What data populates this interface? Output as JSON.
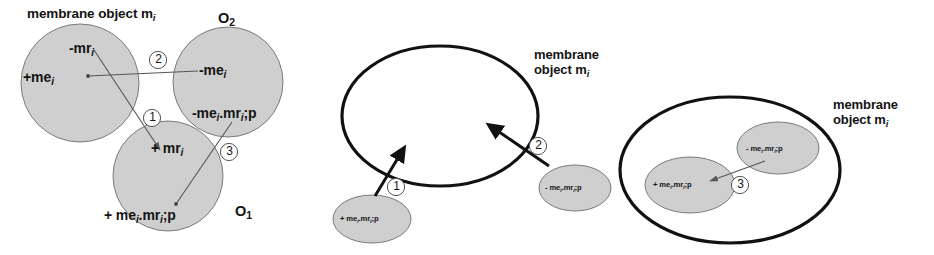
{
  "figure": {
    "colors": {
      "shape_fill": "#cfcfcf",
      "shape_stroke": "#6b6b6b",
      "membrane_stroke": "#111111",
      "line": "#555555",
      "text": "#141414"
    }
  },
  "panel_left": {
    "caption": "membrane object m",
    "caption_sub": "i",
    "circles": [
      {
        "id": "circle-upper-left",
        "labels": [
          {
            "text": "-mr",
            "sub": "i"
          },
          {
            "text": "+me",
            "sub": "i"
          }
        ]
      },
      {
        "id": "circle-upper-right",
        "name": "O",
        "name_sub": "2",
        "labels": [
          {
            "text": "-me",
            "sub": "i"
          },
          {
            "text": "-me",
            "sub": "i",
            "text2": ".mr",
            "sub2": "i",
            "text3": ";p"
          }
        ]
      },
      {
        "id": "circle-bottom",
        "name": "O",
        "name_sub": "1",
        "labels": [
          {
            "text": "+ mr",
            "sub": "i"
          },
          {
            "text": "+ me",
            "sub": "i",
            "text2": ".mr",
            "sub2": "i",
            "text3": ";p"
          }
        ]
      }
    ],
    "connectors": [
      {
        "number": "1"
      },
      {
        "number": "2"
      },
      {
        "number": "3"
      }
    ],
    "label_upper_left_top": "-mr",
    "label_upper_left_top_sub": "i",
    "label_upper_left_mid": "+me",
    "label_upper_left_mid_sub": "i",
    "label_upper_right_top": "-me",
    "label_upper_right_top_sub": "i",
    "label_upper_right_bot_a": "-me",
    "label_upper_right_bot_sub1": "i",
    "label_upper_right_bot_b": ".mr",
    "label_upper_right_bot_sub2": "i",
    "label_upper_right_bot_c": ";p",
    "label_bottom_top": "+ mr",
    "label_bottom_top_sub": "i",
    "label_bottom_bot_a": "+ me",
    "label_bottom_bot_sub1": "i",
    "label_bottom_bot_b": ".mr",
    "label_bottom_bot_sub2": "i",
    "label_bottom_bot_c": ";p",
    "o2_name": "O",
    "o2_sub": "2",
    "o1_name": "O",
    "o1_sub": "1",
    "num1": "1",
    "num2": "2",
    "num3": "3"
  },
  "panel_middle": {
    "caption_line1": "membrane",
    "caption_line2": "object m",
    "caption_sub": "i",
    "ellipse_left": {
      "a": "+ me",
      "sub1": "i",
      "b": ".mr",
      "sub2": "i",
      "c": ";p"
    },
    "ellipse_right": {
      "a": "- me",
      "sub1": "i",
      "b": ".mr",
      "sub2": "i",
      "c": ";p"
    },
    "num1": "1",
    "num2": "2"
  },
  "panel_right": {
    "caption_line1": "membrane",
    "caption_line2": "object m",
    "caption_sub": "i",
    "ellipse_inner_left": {
      "a": "+ me",
      "sub1": "i",
      "b": ".mr",
      "sub2": "i",
      "c": ";p"
    },
    "ellipse_inner_right": {
      "a": "- me",
      "sub1": "i",
      "b": ".mr",
      "sub2": "i",
      "c": ";p"
    },
    "num3": "3"
  }
}
